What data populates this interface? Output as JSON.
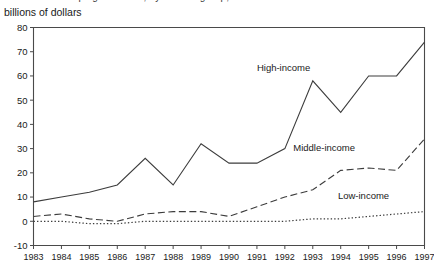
{
  "figure": {
    "clipped_title": "of developing countries, by income group,",
    "subtitle": "billions of dollars"
  },
  "chart_data": {
    "type": "line",
    "title": "",
    "subtitle": "billions of dollars",
    "xlabel": "",
    "ylabel": "billions of dollars",
    "x": [
      1983,
      1984,
      1985,
      1986,
      1987,
      1988,
      1989,
      1990,
      1991,
      1992,
      1993,
      1994,
      1995,
      1996,
      1997
    ],
    "categories": [
      "1983",
      "1984",
      "1985",
      "1986",
      "1987",
      "1988",
      "1989",
      "1990",
      "1991",
      "1992",
      "1993",
      "1994",
      "1995",
      "1996",
      "1997"
    ],
    "xlim": [
      1983,
      1997
    ],
    "ylim": [
      -10,
      80
    ],
    "yticks": [
      -10,
      0,
      10,
      20,
      30,
      40,
      50,
      60,
      70,
      80
    ],
    "ytick_labels": [
      "-10",
      "0",
      "10",
      "20",
      "30",
      "40",
      "50",
      "60",
      "70",
      "80"
    ],
    "grid": false,
    "legend_position": "inline-annotations",
    "series": [
      {
        "name": "High-income",
        "style": "solid",
        "color": "#3c3c3c",
        "label_x": 1991.0,
        "label_y": 62,
        "values": [
          8,
          10,
          12,
          15,
          26,
          15,
          32,
          24,
          24,
          30,
          58,
          45,
          60,
          60,
          74
        ]
      },
      {
        "name": "Middle-income",
        "style": "dashed",
        "color": "#3c3c3c",
        "label_x": 1992.3,
        "label_y": 29,
        "values": [
          2,
          3,
          1,
          0,
          3,
          4,
          4,
          2,
          6,
          10,
          13,
          21,
          22,
          21,
          34
        ]
      },
      {
        "name": "Low-income",
        "style": "dotted",
        "color": "#3c3c3c",
        "label_x": 1993.9,
        "label_y": 9,
        "values": [
          0,
          0,
          -1,
          -1,
          0,
          0,
          0,
          0,
          0,
          0,
          1,
          1,
          2,
          3,
          4
        ]
      }
    ]
  }
}
